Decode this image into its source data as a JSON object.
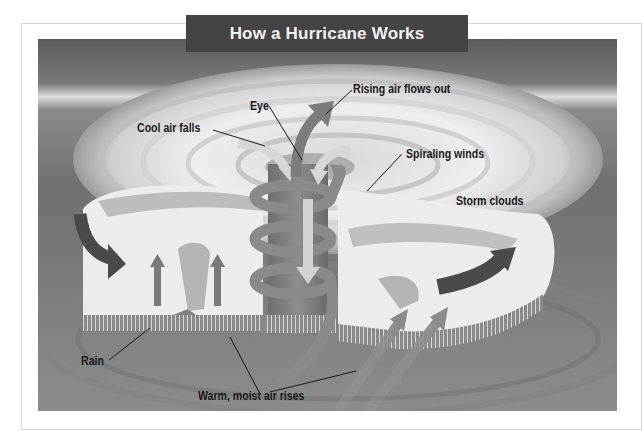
{
  "title": "How a Hurricane Works",
  "labels": {
    "eye": "Eye",
    "cool_air_falls": "Cool air falls",
    "rising_air": "Rising air flows out",
    "spiraling_winds": "Spiraling winds",
    "storm_clouds": "Storm clouds",
    "rain": "Rain",
    "warm_air": "Warm, moist air rises"
  },
  "colors": {
    "title_bg": "#444444",
    "title_text": "#f2f2f2",
    "label_text": "#1a1a1a",
    "sky_top": "#5a5a5a",
    "horizon": "#d9d9d9",
    "ocean": "#7a7a7a",
    "cloud": "#eeeeee",
    "arrow_mid": "#8a8a8a",
    "arrow_dark": "#4a4a4a",
    "arrow_light": "#cfcfcf"
  }
}
